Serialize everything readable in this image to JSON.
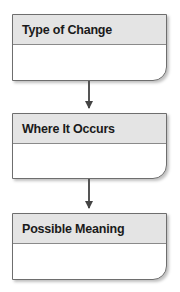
{
  "flowchart": {
    "boxes": [
      {
        "title": "Type of Change",
        "content": ""
      },
      {
        "title": "Where It Occurs",
        "content": ""
      },
      {
        "title": "Possible Meaning",
        "content": ""
      }
    ],
    "connectors": [
      {
        "from": "Type of Change",
        "to": "Where It Occurs"
      },
      {
        "from": "Where It Occurs",
        "to": "Possible Meaning"
      }
    ],
    "colors": {
      "header_bg": "#e4e4e4",
      "border": "#6e6e6e"
    }
  }
}
